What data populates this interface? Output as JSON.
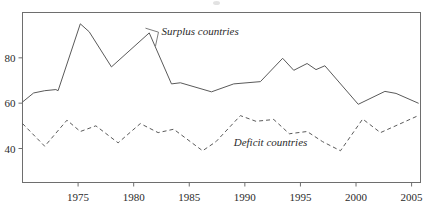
{
  "chart_data": {
    "type": "line",
    "title": "",
    "xlabel": "",
    "ylabel": "",
    "xlim": [
      1970,
      2005.8
    ],
    "ylim": [
      25,
      100
    ],
    "grid": false,
    "legend_position": "inline-annotation",
    "yticks": [
      40,
      60,
      80
    ],
    "ytick_labels": [
      "40",
      "60",
      "80"
    ],
    "xticks": [
      1975,
      1980,
      1985,
      1990,
      1995,
      2000,
      2005
    ],
    "xtick_labels": [
      "1975",
      "1980",
      "1985",
      "1990",
      "1995",
      "2000",
      "2005"
    ],
    "annotations": [
      {
        "text": "Surplus countries",
        "x": 1982.5,
        "y": 90,
        "style": "italic"
      },
      {
        "text": "Deficit countries",
        "x": 1989.0,
        "y": 41,
        "style": "italic"
      }
    ],
    "series": [
      {
        "name": "Surplus countries",
        "style": "solid",
        "color": "#5a5a5a",
        "x": [
          1970.0,
          1971.0,
          1972.0,
          1973.0,
          1973.2,
          1975.2,
          1976.0,
          1978.0,
          1981.4,
          1983.4,
          1984.2,
          1987.0,
          1989.0,
          1991.4,
          1993.4,
          1994.4,
          1995.6,
          1996.4,
          1997.2,
          2000.2,
          2002.6,
          2003.6,
          2005.6
        ],
        "values": [
          60.5,
          64.5,
          65.5,
          66.0,
          65.5,
          95.0,
          91.5,
          76.0,
          91.0,
          68.5,
          69.0,
          65.0,
          68.5,
          69.5,
          79.8,
          74.5,
          77.5,
          74.8,
          76.5,
          59.5,
          65.2,
          64.3,
          60.0
        ]
      },
      {
        "name": "Deficit countries",
        "style": "dashed",
        "color": "#5a5a5a",
        "x": [
          1970.0,
          1972.0,
          1974.0,
          1975.2,
          1976.6,
          1978.6,
          1980.6,
          1982.2,
          1983.6,
          1986.2,
          1987.4,
          1989.6,
          1991.0,
          1992.6,
          1994.0,
          1995.6,
          1997.0,
          1998.6,
          2000.6,
          2002.2,
          2005.6
        ],
        "values": [
          51.0,
          41.0,
          52.5,
          47.5,
          50.0,
          42.5,
          51.0,
          47.0,
          48.5,
          39.0,
          43.0,
          54.5,
          52.0,
          52.8,
          46.5,
          47.5,
          43.0,
          39.0,
          53.0,
          47.0,
          54.5
        ]
      }
    ]
  }
}
